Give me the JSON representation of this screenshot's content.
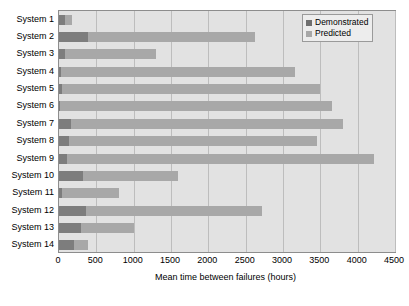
{
  "chart_data": {
    "type": "bar",
    "orientation": "horizontal",
    "stacked": true,
    "title": "",
    "xlabel": "Mean time between failures (hours)",
    "ylabel": "",
    "xlim": [
      0,
      4500
    ],
    "xticks": [
      0,
      500,
      1000,
      1500,
      2000,
      2500,
      3000,
      3500,
      4000,
      4500
    ],
    "xtick_labels": [
      "0",
      "500",
      "1000",
      "1500",
      "2000",
      "2500",
      "3000",
      "3500",
      "4000",
      "4500"
    ],
    "grid": "vertical",
    "legend_position": "top-right",
    "categories": [
      "System 1",
      "System 2",
      "System 3",
      "System 4",
      "System 5",
      "System 6",
      "System 7",
      "System 8",
      "System 9",
      "System 10",
      "System 11",
      "System 12",
      "System 13",
      "System 14"
    ],
    "series": [
      {
        "name": "Demonstrated",
        "color": "#7d7d7d",
        "values": [
          85,
          390,
          80,
          30,
          40,
          15,
          160,
          130,
          105,
          320,
          40,
          360,
          290,
          200
        ]
      },
      {
        "name": "Predicted",
        "color": "#a8a8a8",
        "values": [
          170,
          2620,
          1300,
          3160,
          3490,
          3650,
          3800,
          3460,
          4220,
          1590,
          810,
          2720,
          1000,
          390
        ]
      }
    ]
  },
  "legend": {
    "items": [
      {
        "label": "Demonstrated"
      },
      {
        "label": "Predicted"
      }
    ]
  },
  "colors": {
    "demonstrated": "#7d7d7d",
    "predicted": "#a8a8a8",
    "plot_background": "#e2e2e2",
    "gridline": "#bdbdbd",
    "frame": "#8d8d8d"
  }
}
